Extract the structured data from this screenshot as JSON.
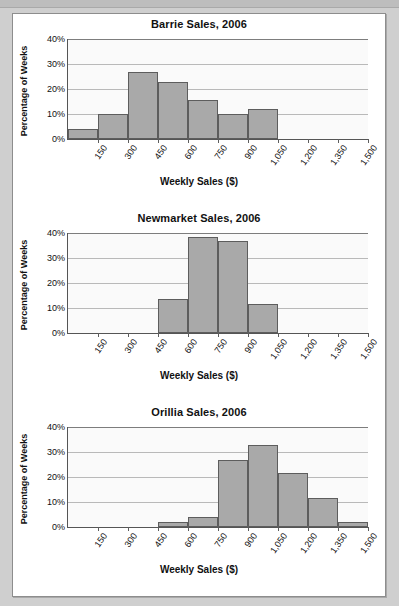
{
  "document": {
    "page_background": "#cfcfcf",
    "panel_background": "#ffffff",
    "bar_fill_color": "#a9a9a9",
    "bar_border_color": "#5d5d5d"
  },
  "charts": [
    {
      "title": "Barrie Sales, 2006",
      "ylabel": "Percentage of Weeks",
      "xlabel": "Weekly Sales ($)"
    },
    {
      "title": "Newmarket Sales, 2006",
      "ylabel": "Percentage of Weeks",
      "xlabel": "Weekly Sales ($)"
    },
    {
      "title": "Orillia Sales, 2006",
      "ylabel": "Percentage of Weeks",
      "xlabel": "Weekly Sales ($)"
    }
  ],
  "chart_data": [
    {
      "type": "bar",
      "title": "Barrie Sales, 2006",
      "xlabel": "Weekly Sales ($)",
      "ylabel": "Percentage of Weeks",
      "ylim": [
        0,
        40
      ],
      "yticks": [
        0,
        10,
        20,
        30,
        40
      ],
      "ytick_labels": [
        "0%",
        "10%",
        "20%",
        "30%",
        "40%"
      ],
      "grid": true,
      "legend": "none",
      "bin_edges": [
        0,
        150,
        300,
        450,
        600,
        750,
        900,
        1050,
        1200,
        1350,
        1500
      ],
      "xtick_labels": [
        "150",
        "300",
        "450",
        "600",
        "750",
        "900",
        "1,050",
        "1,200",
        "1,350",
        "1,500"
      ],
      "categories": [
        "0-150",
        "150-300",
        "300-450",
        "450-600",
        "600-750",
        "750-900",
        "900-1,050",
        "1,050-1,200",
        "1,200-1,350",
        "1,350-1,500"
      ],
      "values": [
        4,
        10,
        27,
        23,
        15.5,
        10,
        12,
        0,
        0,
        0
      ]
    },
    {
      "type": "bar",
      "title": "Newmarket Sales, 2006",
      "xlabel": "Weekly Sales ($)",
      "ylabel": "Percentage of Weeks",
      "ylim": [
        0,
        40
      ],
      "yticks": [
        0,
        10,
        20,
        30,
        40
      ],
      "ytick_labels": [
        "0%",
        "10%",
        "20%",
        "30%",
        "40%"
      ],
      "grid": true,
      "legend": "none",
      "bin_edges": [
        0,
        150,
        300,
        450,
        600,
        750,
        900,
        1050,
        1200,
        1350,
        1500
      ],
      "xtick_labels": [
        "150",
        "300",
        "450",
        "600",
        "750",
        "900",
        "1,050",
        "1,200",
        "1,350",
        "1,500"
      ],
      "categories": [
        "0-150",
        "150-300",
        "300-450",
        "450-600",
        "600-750",
        "750-900",
        "900-1,050",
        "1,050-1,200",
        "1,200-1,350",
        "1,350-1,500"
      ],
      "values": [
        0,
        0,
        0,
        13.5,
        38.5,
        37,
        11.5,
        0,
        0,
        0
      ]
    },
    {
      "type": "bar",
      "title": "Orillia Sales, 2006",
      "xlabel": "Weekly Sales ($)",
      "ylabel": "Percentage of Weeks",
      "ylim": [
        0,
        40
      ],
      "yticks": [
        0,
        10,
        20,
        30,
        40
      ],
      "ytick_labels": [
        "0%",
        "10%",
        "20%",
        "30%",
        "40%"
      ],
      "grid": true,
      "legend": "none",
      "bin_edges": [
        0,
        150,
        300,
        450,
        600,
        750,
        900,
        1050,
        1200,
        1350,
        1500
      ],
      "xtick_labels": [
        "150",
        "300",
        "450",
        "600",
        "750",
        "900",
        "1,050",
        "1,200",
        "1,350",
        "1,500"
      ],
      "categories": [
        "0-150",
        "150-300",
        "300-450",
        "450-600",
        "600-750",
        "750-900",
        "900-1,050",
        "1,050-1,200",
        "1,200-1,350",
        "1,350-1,500"
      ],
      "values": [
        0,
        0,
        0,
        2,
        4,
        27,
        33,
        21.5,
        11.5,
        2
      ]
    }
  ]
}
